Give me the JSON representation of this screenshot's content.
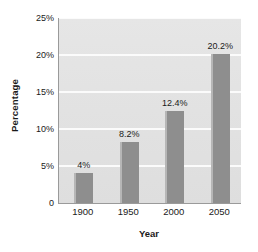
{
  "chart_data": {
    "type": "bar",
    "title": "",
    "categories": [
      "1900",
      "1950",
      "2000",
      "2050"
    ],
    "values": [
      4,
      8.2,
      12.4,
      20.2
    ],
    "data_labels": [
      "4%",
      "8.2%",
      "12.4%",
      "20.2%"
    ],
    "xlabel": "Year",
    "ylabel": "Percentage",
    "ylim": [
      0,
      25
    ],
    "yticks": [
      0,
      5,
      10,
      15,
      20,
      25
    ],
    "ytick_labels": [
      "0",
      "5%",
      "10%",
      "15%",
      "20%",
      "25%"
    ],
    "grid": true,
    "legend": false,
    "colors": {
      "bar": "#8e8e8e",
      "bar_highlight": "#b6b6b6",
      "plot_background": "#e3e3e3",
      "gridline": "#fbfbfb",
      "axis": "#9a9a9a",
      "text": "#1a1a1a",
      "figure_background": "#ffffff"
    }
  }
}
